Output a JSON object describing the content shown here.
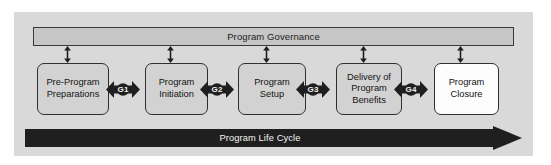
{
  "diagram": {
    "colors": {
      "canvas_background": "#d9d9d9",
      "governance_fill": "#c6c6c6",
      "phase_fill": "#d2d2d2",
      "phase_fill_final": "#fdfdfd",
      "stroke": "#2f2f2f",
      "arrow_dark": "#1f1f1f",
      "text_dark": "#141414",
      "text_light": "#f4f4f4"
    },
    "governance": {
      "label": "Program Governance"
    },
    "lifecycle": {
      "label": "Program Life Cycle",
      "direction": "left-to-right"
    },
    "phases": [
      {
        "id": "pre-program-preparations",
        "label": "Pre-Program\nPreparations",
        "fill": "gray",
        "x": 37,
        "width": 72
      },
      {
        "id": "program-initiation",
        "label": "Program\nInitiation",
        "fill": "gray",
        "x": 145,
        "width": 63
      },
      {
        "id": "program-setup",
        "label": "Program\nSetup",
        "fill": "gray",
        "x": 238,
        "width": 68
      },
      {
        "id": "delivery-of-program-benefits",
        "label": "Delivery of\nProgram\nBenefits",
        "fill": "gray",
        "x": 336,
        "width": 66
      },
      {
        "id": "program-closure",
        "label": "Program\nClosure",
        "fill": "white",
        "x": 434,
        "width": 65
      }
    ],
    "gates": [
      {
        "id": "g1",
        "label": "G1",
        "x": 108,
        "between": [
          "pre-program-preparations",
          "program-initiation"
        ]
      },
      {
        "id": "g2",
        "label": "G2",
        "x": 202,
        "between": [
          "program-initiation",
          "program-setup"
        ]
      },
      {
        "id": "g3",
        "label": "G3",
        "x": 298,
        "between": [
          "program-setup",
          "delivery-of-program-benefits"
        ]
      },
      {
        "id": "g4",
        "label": "G4",
        "x": 396,
        "between": [
          "delivery-of-program-benefits",
          "program-closure"
        ]
      }
    ],
    "connectors": [
      {
        "id": "connector-1",
        "target": "pre-program-preparations",
        "x": 67,
        "type": "double-headed-vertical-arrow"
      },
      {
        "id": "connector-2",
        "target": "program-initiation",
        "x": 170,
        "type": "double-headed-vertical-arrow"
      },
      {
        "id": "connector-3",
        "target": "program-setup",
        "x": 266,
        "type": "double-headed-vertical-arrow"
      },
      {
        "id": "connector-4",
        "target": "delivery-of-program-benefits",
        "x": 363,
        "type": "double-headed-vertical-arrow"
      },
      {
        "id": "connector-5",
        "target": "program-closure",
        "x": 460,
        "type": "double-headed-vertical-arrow"
      }
    ]
  }
}
